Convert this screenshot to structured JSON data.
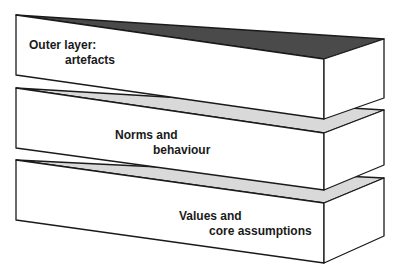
{
  "diagram": {
    "type": "layered-blocks",
    "layers": [
      {
        "line1": "Outer layer:",
        "line2": "artefacts",
        "top_fill": "#4a4a4a"
      },
      {
        "line1": "Norms and",
        "line2": "behaviour",
        "top_fill": "#d9d9d9"
      },
      {
        "line1": "Values and",
        "line2": "core assumptions",
        "top_fill": "#d9d9d9"
      }
    ],
    "colors": {
      "stroke": "#1a1a1a",
      "face": "#ffffff"
    }
  }
}
